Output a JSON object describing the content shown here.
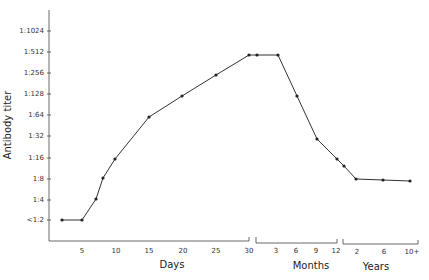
{
  "chart_data": {
    "type": "line",
    "title": "",
    "ylabel": "Antibody titer",
    "xlabel_groups": [
      "Days",
      "Months",
      "Years"
    ],
    "y_ticks": [
      "<1:2",
      "1:4",
      "1:8",
      "1:16",
      "1:32",
      "1:64",
      "1:128",
      "1:256",
      "1:512",
      "1:1024"
    ],
    "x_ticks": {
      "Days": [
        "5",
        "10",
        "15",
        "20",
        "25",
        "30"
      ],
      "Months": [
        "3",
        "6",
        "9",
        "12"
      ],
      "Years": [
        "2",
        "6",
        "10+"
      ]
    },
    "grid": false,
    "legend": null,
    "series": [
      {
        "name": "Antibody titer",
        "points": [
          {
            "x": "Day 1",
            "y": "<1:2"
          },
          {
            "x": "Day 5",
            "y": "<1:2"
          },
          {
            "x": "Day 7",
            "y": "1:4"
          },
          {
            "x": "Day 8",
            "y": "1:8"
          },
          {
            "x": "Day 10",
            "y": "1:16"
          },
          {
            "x": "Day 15",
            "y": "1:64"
          },
          {
            "x": "Day 20",
            "y": "1:128"
          },
          {
            "x": "Day 25",
            "y": "1:256"
          },
          {
            "x": "Day 30",
            "y": "1:512"
          },
          {
            "x": "Month 1",
            "y": "1:512"
          },
          {
            "x": "Month 4",
            "y": "1:512"
          },
          {
            "x": "Month 6",
            "y": "1:128"
          },
          {
            "x": "Month 9",
            "y": "1:32"
          },
          {
            "x": "Month 12",
            "y": "1:16"
          },
          {
            "x": "Year 1",
            "y": "1:12"
          },
          {
            "x": "Year 2",
            "y": "1:8"
          },
          {
            "x": "Year 6",
            "y": "1:8"
          },
          {
            "x": "Year 10+",
            "y": "1:8"
          }
        ],
        "log2_values": [
          1,
          1,
          2,
          3,
          4,
          6,
          7,
          8,
          9,
          9,
          9,
          7,
          5,
          4,
          3.6,
          3,
          3,
          3
        ]
      }
    ],
    "pixel_points": [
      [
        62,
        220
      ],
      [
        82,
        220
      ],
      [
        96,
        199
      ],
      [
        103,
        178
      ],
      [
        115,
        159
      ],
      [
        149,
        117
      ],
      [
        182,
        96
      ],
      [
        216,
        75
      ],
      [
        249,
        55
      ],
      [
        257,
        55
      ],
      [
        278,
        55
      ],
      [
        297,
        96
      ],
      [
        317,
        139
      ],
      [
        337,
        159
      ],
      [
        344,
        166
      ],
      [
        356,
        179
      ],
      [
        383,
        180
      ],
      [
        410,
        181
      ]
    ]
  },
  "labels": {
    "y_title": "Antibody titer",
    "days": "Days",
    "months": "Months",
    "years": "Years",
    "y": {
      "t1024": "1:1024",
      "t512": "1:512",
      "t256": "1:256",
      "t128": "1:128",
      "t64": "1:64",
      "t32": "1:32",
      "t16": "1:16",
      "t8": "1:8",
      "t4": "1:4",
      "t2": "<1:2"
    },
    "x": {
      "d5": "5",
      "d10": "10",
      "d15": "15",
      "d20": "20",
      "d25": "25",
      "d30": "30",
      "m3": "3",
      "m6": "6",
      "m9": "9",
      "m12": "12",
      "y2": "2",
      "y6": "6",
      "y10": "10+"
    }
  }
}
